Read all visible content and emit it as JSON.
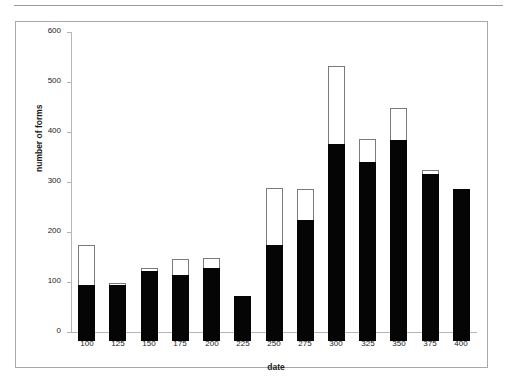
{
  "figure": {
    "top_rule": "horizontal-rule",
    "frame": "chart-frame"
  },
  "chart_data": {
    "type": "bar",
    "title": "",
    "subtitle": "",
    "xlabel": "date",
    "ylabel": "number of forms",
    "categories": [
      "100",
      "125",
      "150",
      "175",
      "200",
      "225",
      "250",
      "275",
      "300",
      "325",
      "350",
      "375",
      "400"
    ],
    "series": [
      {
        "name": "filled",
        "color": "#050505",
        "values": [
          113,
          112,
          140,
          132,
          147,
          90,
          193,
          242,
          394,
          358,
          402,
          334,
          305
        ]
      },
      {
        "name": "open",
        "color": "#ffffff",
        "values": [
          80,
          5,
          7,
          32,
          19,
          0,
          113,
          62,
          156,
          47,
          64,
          8,
          0
        ]
      }
    ],
    "totals": [
      193,
      117,
      147,
      164,
      166,
      90,
      306,
      304,
      550,
      405,
      466,
      342,
      305
    ],
    "ylim": [
      0,
      600
    ],
    "yticks": [
      0,
      100,
      200,
      300,
      400,
      500,
      600
    ],
    "ytick_labels": [
      "0",
      "100",
      "200",
      "300",
      "400",
      "500",
      "600"
    ],
    "xtick_labels": [
      "100",
      "125",
      "150",
      "175",
      "200",
      "225",
      "250",
      "275",
      "300",
      "325",
      "350",
      "375",
      "400"
    ],
    "grid": false,
    "legend": "none",
    "stacked": true
  }
}
